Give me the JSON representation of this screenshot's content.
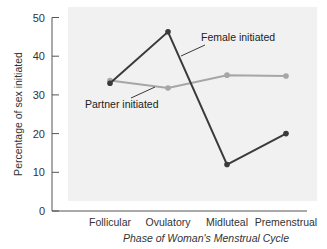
{
  "chart_data": {
    "type": "line",
    "title": "",
    "xlabel": "Phase of Woman's Menstrual Cycle",
    "ylabel": "Percentage of sex initiated",
    "categories": [
      "Follicular",
      "Ovulatory",
      "Midluteal",
      "Premenstrual"
    ],
    "series": [
      {
        "name": "Female initiated",
        "color": "#3a3a3a",
        "values": [
          33,
          46.3,
          12,
          20
        ]
      },
      {
        "name": "Partner initiated",
        "color": "#a6a6a6",
        "values": [
          33.7,
          31.8,
          35.1,
          34.9
        ]
      }
    ],
    "ylim": [
      0,
      50
    ],
    "yticks": [
      0,
      10,
      20,
      30,
      40,
      50
    ],
    "grid": false,
    "legend": "inline annotations with leader lines",
    "annotations": [
      {
        "text": "Female initiated",
        "series": "Female initiated"
      },
      {
        "text": "Partner initiated",
        "series": "Partner initiated"
      }
    ],
    "panel_background": "#f1f1f1"
  }
}
